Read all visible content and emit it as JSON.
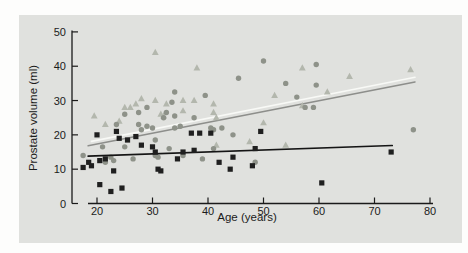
{
  "figure": {
    "page_background": "#fdfdfc",
    "panel_background": "#e0e1de",
    "axis_color": "#1a1a1a"
  },
  "chart_data": {
    "type": "scatter",
    "title": "",
    "xlabel": "Age (years)",
    "ylabel": "Prostate volume (ml)",
    "xlim": [
      17,
      81
    ],
    "ylim": [
      0,
      50
    ],
    "x_ticks": [
      20,
      30,
      40,
      50,
      60,
      70,
      80
    ],
    "y_ticks": [
      0,
      10,
      20,
      30,
      40,
      50
    ],
    "grid": false,
    "legend": "none",
    "series": [
      {
        "name": "triangles",
        "marker": "triangle",
        "color": "#b3b7ad",
        "points": [
          [
            19.5,
            25.5
          ],
          [
            21.5,
            23
          ],
          [
            24,
            24
          ],
          [
            25,
            28
          ],
          [
            26,
            28
          ],
          [
            27,
            29
          ],
          [
            28,
            30.5
          ],
          [
            30.5,
            30
          ],
          [
            30.5,
            44
          ],
          [
            31.5,
            26
          ],
          [
            32,
            25.5
          ],
          [
            32.5,
            29
          ],
          [
            35.5,
            27
          ],
          [
            35.5,
            30
          ],
          [
            37.5,
            30
          ],
          [
            38,
            39.5
          ],
          [
            41,
            29
          ],
          [
            41,
            26.5
          ],
          [
            41.5,
            25
          ],
          [
            41.5,
            17
          ],
          [
            47.5,
            18
          ],
          [
            50,
            23.5
          ],
          [
            52,
            31.5
          ],
          [
            54,
            17
          ],
          [
            57,
            39.5
          ],
          [
            57,
            28.5
          ],
          [
            61.5,
            32.5
          ],
          [
            65.5,
            37
          ],
          [
            76.5,
            39
          ]
        ]
      },
      {
        "name": "circles",
        "marker": "circle",
        "color": "#8e9289",
        "points": [
          [
            17.5,
            14
          ],
          [
            21,
            16.5
          ],
          [
            21.5,
            12
          ],
          [
            22.5,
            13.5
          ],
          [
            23,
            12.5
          ],
          [
            23.5,
            23
          ],
          [
            25,
            16.5
          ],
          [
            25,
            26
          ],
          [
            26.5,
            13
          ],
          [
            27.5,
            23
          ],
          [
            27.5,
            26.5
          ],
          [
            28,
            21.5
          ],
          [
            29,
            28
          ],
          [
            29,
            22.5
          ],
          [
            30,
            22
          ],
          [
            30.5,
            14
          ],
          [
            30.5,
            18.5
          ],
          [
            31,
            13.5
          ],
          [
            32,
            25
          ],
          [
            32.5,
            26.5
          ],
          [
            33,
            16
          ],
          [
            33.5,
            29.5
          ],
          [
            34,
            22
          ],
          [
            34,
            32.5
          ],
          [
            34,
            25.5
          ],
          [
            35,
            22.5
          ],
          [
            35.5,
            14
          ],
          [
            37.5,
            25
          ],
          [
            39,
            13
          ],
          [
            39.5,
            31.5
          ],
          [
            40.5,
            22
          ],
          [
            41,
            21.5
          ],
          [
            41,
            16
          ],
          [
            42.5,
            22
          ],
          [
            44.5,
            20
          ],
          [
            45.5,
            36.5
          ],
          [
            48.5,
            12
          ],
          [
            50,
            41.5
          ],
          [
            54,
            35
          ],
          [
            56,
            31
          ],
          [
            57.5,
            28
          ],
          [
            59,
            28
          ],
          [
            59.5,
            40.5
          ],
          [
            59.5,
            34.5
          ],
          [
            77,
            21.5
          ]
        ]
      },
      {
        "name": "squares",
        "marker": "square",
        "color": "#1f1f1f",
        "points": [
          [
            17.5,
            10.5
          ],
          [
            18.5,
            12
          ],
          [
            19,
            11
          ],
          [
            20.5,
            12.5
          ],
          [
            21.5,
            13
          ],
          [
            20,
            20
          ],
          [
            20.5,
            5.5
          ],
          [
            22.5,
            3.5
          ],
          [
            24.5,
            4.5
          ],
          [
            23,
            9.5
          ],
          [
            23.5,
            21
          ],
          [
            24,
            19
          ],
          [
            25.5,
            18.5
          ],
          [
            27,
            19.5
          ],
          [
            28,
            17
          ],
          [
            30,
            16.5
          ],
          [
            30.5,
            15
          ],
          [
            31,
            10
          ],
          [
            31.5,
            9.5
          ],
          [
            34.5,
            13
          ],
          [
            35.5,
            15
          ],
          [
            37,
            20.5
          ],
          [
            37.5,
            15.5
          ],
          [
            38.5,
            20.5
          ],
          [
            40.5,
            20.5
          ],
          [
            42,
            12
          ],
          [
            44,
            10
          ],
          [
            44.5,
            13.5
          ],
          [
            48,
            11
          ],
          [
            48.5,
            16
          ],
          [
            49.5,
            21
          ],
          [
            60.5,
            6
          ],
          [
            73,
            15
          ]
        ]
      }
    ],
    "trend_lines": [
      {
        "name": "squares-trend",
        "color": "#151515",
        "width": 1.7,
        "from": [
          18.4,
          13.8
        ],
        "to": [
          73.2,
          16.9
        ]
      },
      {
        "name": "circles-trend",
        "color": "#8d8e8b",
        "width": 1.5,
        "from": [
          18.4,
          16.8
        ],
        "to": [
          77.3,
          35.4
        ]
      },
      {
        "name": "triangles-trend",
        "color": "#f8f9f6",
        "width": 1.6,
        "from": [
          19.0,
          18.1
        ],
        "to": [
          77.3,
          36.8
        ]
      }
    ]
  }
}
